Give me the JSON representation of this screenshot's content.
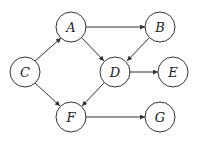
{
  "diagram": {
    "type": "directed-graph",
    "colors": {
      "stroke": "#333333",
      "fill": "#ffffff",
      "text": "#222222"
    },
    "nodes": [
      {
        "id": "A",
        "label": "A",
        "x": 71,
        "y": 27
      },
      {
        "id": "B",
        "label": "B",
        "x": 160,
        "y": 27
      },
      {
        "id": "C",
        "label": "C",
        "x": 25,
        "y": 72
      },
      {
        "id": "D",
        "label": "D",
        "x": 115,
        "y": 72
      },
      {
        "id": "E",
        "label": "E",
        "x": 173,
        "y": 72
      },
      {
        "id": "F",
        "label": "F",
        "x": 71,
        "y": 117
      },
      {
        "id": "G",
        "label": "G",
        "x": 160,
        "y": 117
      }
    ],
    "edges": [
      {
        "from": "C",
        "to": "A"
      },
      {
        "from": "C",
        "to": "F"
      },
      {
        "from": "A",
        "to": "B"
      },
      {
        "from": "A",
        "to": "D"
      },
      {
        "from": "B",
        "to": "D"
      },
      {
        "from": "D",
        "to": "E"
      },
      {
        "from": "D",
        "to": "F"
      },
      {
        "from": "F",
        "to": "G"
      }
    ]
  }
}
